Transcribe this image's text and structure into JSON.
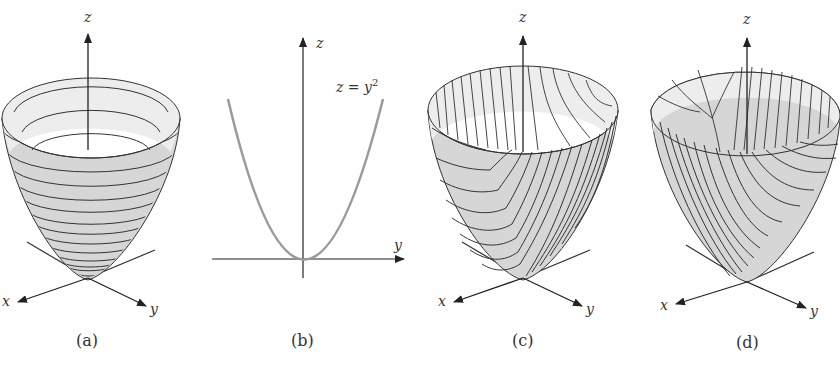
{
  "figure": {
    "panels": [
      {
        "id": "a",
        "caption": "(a)",
        "description": "Paraboloid z = x^2 + y^2 with horizontal circular level curves",
        "axis_labels": {
          "x": "x",
          "y": "y",
          "z": "z"
        }
      },
      {
        "id": "b",
        "caption": "(b)",
        "description": "2D cross-section parabola",
        "equation_lhs": "z = y",
        "equation_exp": "2",
        "axis_labels": {
          "y": "y",
          "z": "z"
        }
      },
      {
        "id": "c",
        "caption": "(c)",
        "description": "Paraboloid with parabolic traces in planes x = constant",
        "axis_labels": {
          "x": "x",
          "y": "y",
          "z": "z"
        }
      },
      {
        "id": "d",
        "caption": "(d)",
        "description": "Paraboloid with parabolic traces in planes y = constant",
        "axis_labels": {
          "x": "x",
          "y": "y",
          "z": "z"
        }
      }
    ],
    "colors": {
      "surface": "#d4d4d4",
      "surface_inner": "#ececec",
      "lines": "#333333",
      "curve": "#9a9a9a"
    }
  }
}
